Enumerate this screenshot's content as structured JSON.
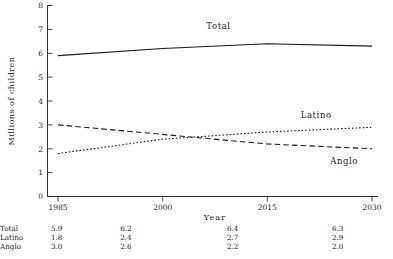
{
  "chart_data": {
    "type": "line",
    "title": "",
    "xlabel": "Year",
    "ylabel": "Millions of children",
    "x": [
      1985,
      2000,
      2015,
      2030
    ],
    "xticklabels": [
      "1985",
      "2000",
      "2015",
      "2030"
    ],
    "yticklabels": [
      "0",
      "1",
      "2",
      "3",
      "4",
      "5",
      "6",
      "7",
      "8"
    ],
    "xlim": [
      1985,
      2030
    ],
    "ylim": [
      0,
      8
    ],
    "grid": false,
    "legend": "inline-series-labels",
    "series": [
      {
        "name": "Total",
        "values": [
          5.9,
          6.2,
          6.4,
          6.3
        ],
        "style": "solid"
      },
      {
        "name": "Latino",
        "values": [
          1.8,
          2.4,
          2.7,
          2.9
        ],
        "style": "dotted"
      },
      {
        "name": "Anglo",
        "values": [
          3.0,
          2.6,
          2.2,
          2.0
        ],
        "style": "dashed"
      }
    ],
    "annotations": [
      {
        "text": "Total",
        "x": 2008,
        "y": 7.0
      },
      {
        "text": "Latino",
        "x": 2022,
        "y": 3.3
      },
      {
        "text": "Anglo",
        "x": 2026,
        "y": 1.35
      }
    ]
  },
  "table": {
    "rows": [
      {
        "label": "Total",
        "values": [
          "5.9",
          "6.2",
          "6.4",
          "6.3"
        ]
      },
      {
        "label": "Latino",
        "values": [
          "1.8",
          "2.4",
          "2.7",
          "2.9"
        ]
      },
      {
        "label": "Anglo",
        "values": [
          "3.0",
          "2.6",
          "2.2",
          "2.0"
        ]
      }
    ]
  }
}
